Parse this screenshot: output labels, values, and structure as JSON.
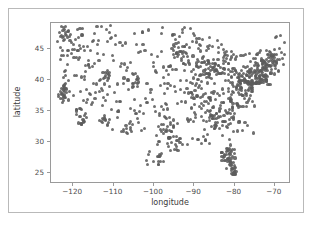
{
  "figure": {
    "width": 313,
    "height": 225,
    "background": "#ffffff",
    "border_color": "#b9b9b9",
    "axes_frame_color": "#9a9a9a"
  },
  "chart_data": {
    "type": "scatter",
    "title": "",
    "xlabel": "longitude",
    "ylabel": "latitude",
    "xlim": [
      -125.5,
      -66.0
    ],
    "ylim": [
      23.2,
      49.2
    ],
    "xticks": [
      -120,
      -110,
      -100,
      -90,
      -80,
      -70
    ],
    "xticklabels": [
      "−120",
      "−110",
      "−100",
      "−90",
      "−80",
      "−70"
    ],
    "yticks": [
      25,
      30,
      35,
      40,
      45
    ],
    "yticklabels": [
      "25",
      "30",
      "35",
      "40",
      "45"
    ],
    "grid": false,
    "legend": null,
    "marker": {
      "shape": "circle",
      "color": "#5c5c5c",
      "size_px": 3.1,
      "opacity": 0.88
    },
    "n_points": 520,
    "x": [
      -122.4,
      -122.7,
      -122.3,
      -121.9,
      -121.5,
      -122.1,
      -123.1,
      -122.0,
      -121.3,
      -122.6,
      -118.2,
      -118.5,
      -117.9,
      -117.2,
      -117.8,
      -116.5,
      -118.4,
      -119.0,
      -119.8,
      -120.5,
      -121.0,
      -121.4,
      -122.0,
      -122.8,
      -123.5,
      -124.0,
      -123.2,
      -122.5,
      -121.8,
      -120.9,
      -119.7,
      -118.8,
      -117.4,
      -116.2,
      -115.1,
      -114.6,
      -115.9,
      -116.8,
      -117.6,
      -118.1,
      -112.1,
      -111.9,
      -112.5,
      -111.0,
      -110.9,
      -111.7,
      -112.8,
      -113.5,
      -114.1,
      -110.3,
      -109.5,
      -108.6,
      -107.8,
      -106.6,
      -105.0,
      -104.9,
      -105.5,
      -106.3,
      -107.1,
      -108.2,
      -104.8,
      -105.2,
      -104.6,
      -103.9,
      -102.3,
      -101.8,
      -100.9,
      -100.3,
      -99.7,
      -98.5,
      -97.7,
      -97.4,
      -96.8,
      -96.0,
      -95.4,
      -95.9,
      -96.5,
      -97.1,
      -97.9,
      -98.2,
      -95.3,
      -94.6,
      -93.9,
      -93.2,
      -92.6,
      -92.1,
      -91.5,
      -90.8,
      -90.2,
      -89.6,
      -89.0,
      -88.4,
      -87.9,
      -87.6,
      -87.2,
      -86.8,
      -86.3,
      -85.7,
      -85.1,
      -84.5,
      -84.0,
      -83.5,
      -83.0,
      -82.5,
      -82.0,
      -81.4,
      -80.8,
      -80.2,
      -79.6,
      -79.0,
      -78.5,
      -77.9,
      -77.4,
      -76.8,
      -76.2,
      -75.6,
      -75.1,
      -74.5,
      -74.0,
      -73.5,
      -73.0,
      -72.4,
      -71.9,
      -71.4,
      -70.8,
      -70.3,
      -69.7,
      -69.0,
      -68.4,
      -67.9,
      -122.3,
      -121.7,
      -120.6,
      -119.4,
      -118.9,
      -117.3,
      -116.0,
      -114.9,
      -113.8,
      -112.7,
      -111.5,
      -110.4,
      -109.2,
      -108.0,
      -106.9,
      -105.7,
      -104.5,
      -103.4,
      -102.2,
      -101.1,
      -99.9,
      -98.8,
      -97.6,
      -96.4,
      -95.3,
      -94.1,
      -93.0,
      -91.8,
      -90.7,
      -89.5,
      -88.3,
      -87.2,
      -86.0,
      -84.9,
      -83.7,
      -82.6,
      -81.4,
      -80.3,
      -79.1,
      -78.0,
      -76.8,
      -75.7,
      -74.5,
      -73.4,
      -72.2,
      -71.1,
      -70.0,
      -68.8,
      -67.7,
      -122.9,
      -120.2,
      -117.7,
      -115.3,
      -112.9,
      -110.6,
      -108.3,
      -105.9,
      -103.6,
      -101.3,
      -99.0,
      -96.7,
      -94.4,
      -92.1,
      -89.8,
      -87.5,
      -85.2,
      -82.9,
      -80.6,
      -78.3,
      -76.0,
      -73.7,
      -71.4,
      -69.1,
      -121.2,
      -118.0,
      -114.8,
      -111.6,
      -108.4,
      -105.2,
      -102.0,
      -98.8,
      -95.6,
      -92.4,
      -89.2,
      -86.0,
      -82.8,
      -79.6,
      -76.4,
      -73.2,
      -70.0,
      -84.3,
      -84.0,
      -83.6,
      -82.8,
      -82.3,
      -81.9,
      -81.6,
      -81.3,
      -81.0,
      -80.7,
      -80.4,
      -80.2,
      -80.1,
      -80.5,
      -81.1,
      -81.7,
      -82.2,
      -82.6,
      -83.1,
      -80.9,
      -80.6,
      -80.3,
      -81.2,
      -81.5,
      -82.0,
      -97.3,
      -98.0,
      -98.7,
      -99.4,
      -100.1,
      -97.0,
      -96.3,
      -95.7,
      -95.0,
      -94.3,
      -93.6,
      -99.1,
      -100.5,
      -101.9,
      -103.3,
      -95.2,
      -94.9,
      -94.5,
      -93.8,
      -93.4,
      -92.9,
      -92.4,
      -91.9,
      -91.3,
      -90.9,
      -90.4,
      -89.9,
      -89.3,
      -88.8,
      -88.2,
      -87.7,
      -87.0,
      -86.5,
      -85.9,
      -85.4,
      -84.8,
      -84.2,
      -83.8,
      -83.3,
      -82.7,
      -82.1,
      -81.8,
      -81.0,
      -80.4,
      -79.8,
      -79.3,
      -78.7,
      -78.1,
      -77.6,
      -77.0,
      -76.5,
      -75.9,
      -75.3,
      -74.8,
      -74.2,
      -73.8,
      -73.3,
      -72.7,
      -72.1,
      -71.6,
      -71.0,
      -70.5,
      -69.9,
      -69.3,
      -68.7,
      -88.9,
      -88.1,
      -87.4,
      -86.7,
      -86.1,
      -85.5,
      -84.9,
      -84.4,
      -83.9,
      -83.2,
      -82.9,
      -82.4,
      -81.9,
      -81.3,
      -80.8,
      -80.1,
      -79.5,
      -78.9,
      -78.3,
      -77.7,
      -77.2,
      -76.6,
      -76.1,
      -75.5,
      -74.9,
      -74.3,
      -73.9,
      -73.4,
      -72.8,
      -72.3,
      -71.7,
      -71.2,
      -70.6,
      -70.1,
      -69.5,
      -93.1,
      -92.5,
      -91.7,
      -91.1,
      -90.5,
      -90.0,
      -89.4,
      -88.6,
      -88.0,
      -87.3,
      -86.6,
      -86.2,
      -85.6,
      -85.0,
      -84.6,
      -92.8,
      -92.2,
      -91.6,
      -90.6,
      -89.9,
      -89.1,
      -88.5,
      -87.8,
      -87.1,
      -86.4,
      -122.2,
      -121.6,
      -120.8,
      -119.9,
      -119.2,
      -118.6,
      -117.1,
      -116.4,
      -115.6,
      -114.3,
      -113.2,
      -112.3,
      -111.2,
      -110.1,
      -109.0,
      -107.5,
      -106.1,
      -104.2,
      -102.8,
      -101.5,
      -100.2,
      -99.3,
      -98.1,
      -96.9,
      -95.8,
      -94.8,
      -93.7,
      -92.7,
      -91.4,
      -90.1,
      -120.0,
      -118.3,
      -116.7,
      -115.0,
      -113.4,
      -112.0,
      -110.7,
      -109.4,
      -108.1,
      -106.5,
      -105.4,
      -104.1,
      -102.7,
      -101.4,
      -100.0,
      -98.6,
      -97.2,
      -95.9,
      -94.7,
      -93.3,
      -76.3,
      -75.8,
      -75.2,
      -74.7,
      -74.1,
      -73.6,
      -73.1,
      -72.6,
      -72.0,
      -71.5,
      -71.1,
      -70.7,
      -70.2,
      -69.6,
      -68.9,
      -68.2,
      -67.6,
      -78.8,
      -78.2,
      -77.5,
      -84.7,
      -85.3,
      -85.8,
      -86.9,
      -87.5,
      -88.7,
      -89.7,
      -90.3,
      -91.0,
      -91.2,
      -122.5,
      -121.1,
      -119.6,
      -118.7,
      -117.5,
      -116.9,
      -115.5,
      -114.4,
      -113.0,
      -112.4,
      -123.0,
      -122.4,
      -121.9,
      -120.4,
      -119.1,
      -117.0,
      -116.3,
      -115.8,
      -114.7,
      -113.9,
      -83.4,
      -82.2,
      -81.7,
      -80.0,
      -79.4,
      -78.6,
      -77.8,
      -77.3,
      -76.7,
      -76.4,
      -86.4,
      -85.0,
      -83.9,
      -82.7,
      -81.5,
      -80.5,
      -79.2,
      -78.4,
      -77.1,
      -76.9,
      -95.5,
      -94.2,
      -93.5,
      -92.3,
      -91.6,
      -90.7,
      -89.2,
      -88.3,
      -87.6,
      -86.1,
      -104.4,
      -103.1,
      -102.5,
      -101.6,
      -100.7,
      -99.5,
      -98.3,
      -97.5,
      -96.6,
      -95.1,
      -110.8,
      -109.8,
      -108.9,
      -107.4,
      -106.8,
      -105.8,
      -104.7,
      -103.8,
      -102.9,
      -101.7,
      -116.1,
      -115.2,
      -114.0,
      -113.6,
      -112.6,
      -111.4,
      -110.2,
      -109.1,
      -108.7,
      -107.2
    ]
  },
  "axis": {
    "x_label": "longitude",
    "y_label": "latitude"
  }
}
